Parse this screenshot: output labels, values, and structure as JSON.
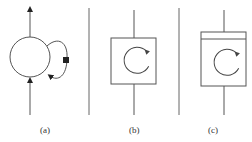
{
  "figure": {
    "panels": [
      {
        "id": "a",
        "label": "(a)",
        "kind": "circle-with-feedback-loop"
      },
      {
        "id": "b",
        "label": "(b)",
        "kind": "box-with-rotation-arrow"
      },
      {
        "id": "c",
        "label": "(c)",
        "kind": "box-with-header-and-rotation-arrow"
      }
    ],
    "colors": {
      "stroke": "#555555",
      "fill_marker": "#222222",
      "background": "#ffffff"
    }
  }
}
